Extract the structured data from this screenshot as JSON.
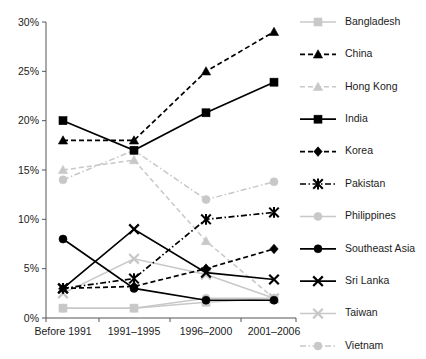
{
  "chart_data": {
    "type": "line",
    "title": "",
    "xlabel": "",
    "ylabel": "",
    "categories": [
      "Before 1991",
      "1991–1995",
      "1996–2000",
      "2001–2006"
    ],
    "ylim": [
      0,
      30
    ],
    "ytick_labels": [
      "0%",
      "5%",
      "10%",
      "15%",
      "20%",
      "25%",
      "30%"
    ],
    "ytick_values": [
      0,
      5,
      10,
      15,
      20,
      25,
      30
    ],
    "grid": false,
    "legend_position": "right",
    "value_suffix": "%",
    "series": [
      {
        "name": "Bangladesh",
        "values": [
          1.0,
          1.0,
          1.6,
          2.0
        ],
        "color": "#c8c8c8",
        "marker": "square",
        "dash": "solid"
      },
      {
        "name": "China",
        "values": [
          18.0,
          18.0,
          25.0,
          29.0
        ],
        "color": "#000000",
        "marker": "triangle",
        "dash": "dashed"
      },
      {
        "name": "Hong Kong",
        "values": [
          15.0,
          16.0,
          7.8,
          2.0
        ],
        "color": "#c8c8c8",
        "marker": "triangle",
        "dash": "dashed"
      },
      {
        "name": "India",
        "values": [
          20.0,
          17.0,
          20.8,
          23.9
        ],
        "color": "#000000",
        "marker": "square",
        "dash": "solid"
      },
      {
        "name": "Korea",
        "values": [
          3.0,
          3.2,
          5.0,
          7.0
        ],
        "color": "#000000",
        "marker": "diamond",
        "dash": "dashed"
      },
      {
        "name": "Pakistan",
        "values": [
          3.0,
          4.0,
          10.0,
          10.7
        ],
        "color": "#000000",
        "marker": "asterisk",
        "dash": "dashdot"
      },
      {
        "name": "Philippines",
        "values": [
          1.0,
          1.0,
          2.0,
          2.0
        ],
        "color": "#c8c8c8",
        "marker": "circle",
        "dash": "solid"
      },
      {
        "name": "Southeast Asia",
        "values": [
          8.0,
          3.0,
          1.8,
          1.8
        ],
        "color": "#000000",
        "marker": "circle",
        "dash": "solid"
      },
      {
        "name": "Sri Lanka",
        "values": [
          3.0,
          9.0,
          4.6,
          3.9
        ],
        "color": "#000000",
        "marker": "cross",
        "dash": "solid"
      },
      {
        "name": "Taiwan",
        "values": [
          2.5,
          6.0,
          4.4,
          2.0
        ],
        "color": "#c8c8c8",
        "marker": "cross",
        "dash": "solid"
      },
      {
        "name": "Vietnam",
        "values": [
          14.0,
          17.0,
          12.0,
          13.8
        ],
        "color": "#c8c8c8",
        "marker": "circle",
        "dash": "dashdot"
      }
    ]
  },
  "legend": {
    "items": [
      {
        "label": "Bangladesh"
      },
      {
        "label": "China"
      },
      {
        "label": "Hong Kong"
      },
      {
        "label": "India"
      },
      {
        "label": "Korea"
      },
      {
        "label": "Pakistan"
      },
      {
        "label": "Philippines"
      },
      {
        "label": "Southeast Asia"
      },
      {
        "label": "Sri Lanka"
      },
      {
        "label": "Taiwan"
      },
      {
        "label": "Vietnam"
      }
    ]
  }
}
